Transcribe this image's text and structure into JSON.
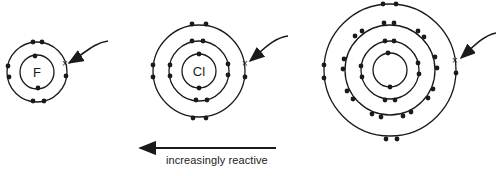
{
  "atoms": [
    {
      "symbol": "F",
      "name": "fluorine",
      "cx": 37,
      "cy": 72,
      "shells": [
        17,
        30
      ]
    },
    {
      "symbol": "Cl",
      "name": "chlorine",
      "cx": 199,
      "cy": 71,
      "shells": [
        17,
        30,
        46
      ]
    },
    {
      "symbol": "",
      "name": "bromine",
      "cx": 390,
      "cy": 70,
      "shells": [
        17,
        29,
        45,
        66
      ]
    }
  ],
  "marker": "×",
  "arrow_label": "increasingly reactive",
  "colors": {
    "line": "#1a1a1a",
    "background": "#ffffff"
  }
}
